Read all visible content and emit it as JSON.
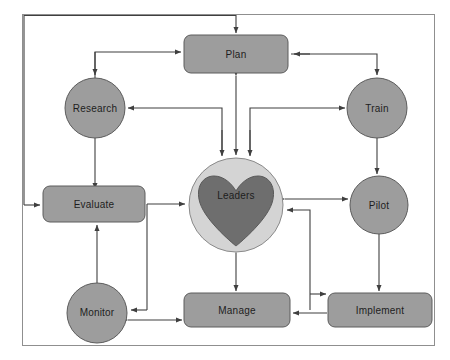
{
  "diagram": {
    "canvas": {
      "width": 450,
      "height": 360,
      "background": "#ffffff"
    },
    "colors": {
      "node_fill": "#9d9d9d",
      "node_stroke": "#5c5c5c",
      "ring_fill": "#d4d4d4",
      "heart_fill": "#6e6e6e",
      "connector": "#3f3f3f",
      "frame": "#8f8f8f",
      "label_text": "#1d1d1d"
    },
    "nodes": [
      {
        "id": "plan",
        "label": "Plan",
        "shape": "rounded-rect",
        "cx": 236,
        "cy": 54,
        "w": 104,
        "h": 38
      },
      {
        "id": "research",
        "label": "Research",
        "shape": "circle",
        "cx": 95,
        "cy": 108,
        "r": 30
      },
      {
        "id": "train",
        "label": "Train",
        "shape": "circle",
        "cx": 377,
        "cy": 108,
        "r": 30
      },
      {
        "id": "evaluate",
        "label": "Evaluate",
        "shape": "rounded-rect",
        "cx": 94,
        "cy": 204,
        "w": 102,
        "h": 36
      },
      {
        "id": "leaders",
        "label": "Leaders",
        "shape": "circle-heart",
        "cx": 236,
        "cy": 205,
        "r": 47
      },
      {
        "id": "pilot",
        "label": "Pilot",
        "shape": "circle",
        "cx": 379,
        "cy": 205,
        "r": 29
      },
      {
        "id": "monitor",
        "label": "Monitor",
        "shape": "circle",
        "cx": 97,
        "cy": 313,
        "r": 30
      },
      {
        "id": "manage",
        "label": "Manage",
        "shape": "rounded-rect",
        "cx": 237,
        "cy": 310,
        "w": 106,
        "h": 34
      },
      {
        "id": "implement",
        "label": "Implement",
        "shape": "rounded-rect",
        "cx": 380,
        "cy": 310,
        "w": 104,
        "h": 34
      }
    ],
    "edges": [
      {
        "from": "evaluate",
        "to": "plan",
        "arrows": "one-way"
      },
      {
        "from": "research",
        "to": "plan",
        "arrows": "one-way"
      },
      {
        "from": "plan",
        "to": "research",
        "arrows": "one-way"
      },
      {
        "from": "plan",
        "to": "train",
        "arrows": "one-way"
      },
      {
        "from": "plan",
        "to": "leaders",
        "arrows": "two-way"
      },
      {
        "from": "leaders",
        "to": "research",
        "arrows": "one-way"
      },
      {
        "from": "leaders",
        "to": "train",
        "arrows": "one-way"
      },
      {
        "from": "research",
        "to": "evaluate",
        "arrows": "one-way"
      },
      {
        "from": "train",
        "to": "pilot",
        "arrows": "two-way"
      },
      {
        "from": "leaders",
        "to": "pilot",
        "arrows": "two-way"
      },
      {
        "from": "evaluate",
        "to": "leaders",
        "arrows": "one-way"
      },
      {
        "from": "leaders",
        "to": "manage",
        "arrows": "two-way"
      },
      {
        "from": "monitor",
        "to": "evaluate",
        "arrows": "one-way"
      },
      {
        "from": "monitor",
        "to": "manage",
        "arrows": "two-way"
      },
      {
        "from": "manage",
        "to": "monitor",
        "arrows": "one-way"
      },
      {
        "from": "implement",
        "to": "manage",
        "arrows": "one-way"
      },
      {
        "from": "implement",
        "to": "leaders",
        "arrows": "one-way"
      },
      {
        "from": "pilot",
        "to": "implement",
        "arrows": "one-way"
      }
    ]
  }
}
